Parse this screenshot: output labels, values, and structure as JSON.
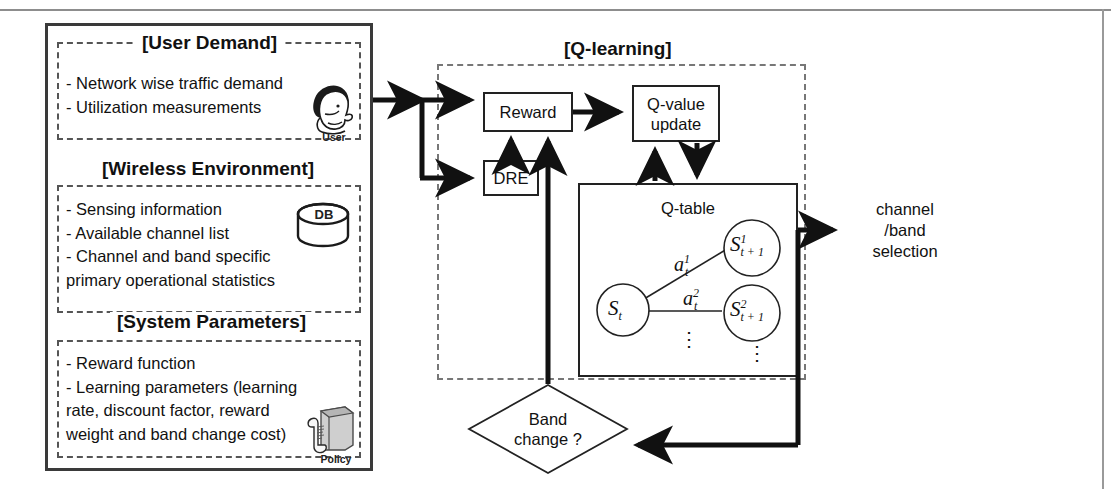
{
  "diagram": {
    "left_panel": {
      "sections": [
        {
          "header": "[User Demand]",
          "bullets": [
            "- Network wise traffic demand",
            "- Utilization measurements"
          ],
          "icon": "user-head-icon",
          "icon_label": "User"
        },
        {
          "header": "[Wireless Environment]",
          "bullets": [
            "- Sensing information",
            "- Available channel list",
            "- Channel and band specific",
            "primary operational statistics"
          ],
          "icon": "database-icon",
          "icon_label": "DB"
        },
        {
          "header": "[System Parameters]",
          "bullets": [
            "- Reward function",
            "- Learning parameters (learning",
            "rate, discount factor, reward",
            "weight and band change cost)"
          ],
          "icon": "policy-scroll-icon",
          "icon_label": "Policy"
        }
      ]
    },
    "qlearning": {
      "header": "[Q-learning]",
      "blocks": [
        {
          "name": "reward",
          "label": "Reward"
        },
        {
          "name": "dre",
          "label": "DRE"
        },
        {
          "name": "qvalue",
          "label_line1": "Q-value",
          "label_line2": "update"
        },
        {
          "name": "qtable",
          "label": "Q-table"
        }
      ],
      "qtable_graph": {
        "nodes": [
          {
            "id": "s_t",
            "base": "S",
            "sub": "t",
            "sup": ""
          },
          {
            "id": "s_t1_1",
            "base": "S",
            "sub": "t + 1",
            "sup": "1"
          },
          {
            "id": "s_t1_2",
            "base": "S",
            "sub": "t + 1",
            "sup": "2"
          }
        ],
        "edges": [
          {
            "from": "s_t",
            "to": "s_t1_1",
            "base": "a",
            "sub": "t",
            "sup": "1"
          },
          {
            "from": "s_t",
            "to": "s_t1_2",
            "base": "a",
            "sub": "t",
            "sup": "2"
          }
        ],
        "ellipsis": "⋮"
      }
    },
    "decision": {
      "label_line1": "Band",
      "label_line2": "change ?"
    },
    "output": {
      "line1": "channel",
      "line2": "/band",
      "line3": "selection"
    },
    "colors": {
      "stroke": "#222222",
      "dashed": "#777777",
      "frame": "#3a3a3a",
      "background": "#ffffff"
    }
  }
}
